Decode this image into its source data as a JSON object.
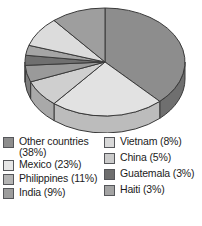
{
  "chart_data": {
    "type": "pie",
    "title": "",
    "subtitle": "",
    "xlabel": "",
    "ylabel": "",
    "legend_position": "bottom",
    "grid": false,
    "three_d": true,
    "start_angle_deg": 0,
    "direction": "clockwise",
    "categories": [
      "Other countries",
      "Mexico",
      "Philippines",
      "India",
      "Vietnam",
      "China",
      "Guatemala",
      "Haiti"
    ],
    "values": [
      38,
      23,
      11,
      9,
      8,
      5,
      3,
      3
    ],
    "units": "percent",
    "slices": [
      {
        "label": "Other countries",
        "value": 38,
        "percent_text": "(38%)",
        "color": "#8d8d8d",
        "side_color": "#6f6f6f"
      },
      {
        "label": "Mexico",
        "value": 23,
        "percent_text": "(23%)",
        "color": "#e2e2e2",
        "side_color": "#bcbcbc"
      },
      {
        "label": "Vietnam",
        "value": 8,
        "percent_text": "(8%)",
        "color": "#cfcfcf",
        "side_color": "#a9a9a9"
      },
      {
        "label": "China",
        "value": 5,
        "percent_text": "(5%)",
        "color": "#9a9a9a",
        "side_color": "#7d7d7d"
      },
      {
        "label": "Guatemala",
        "value": 3,
        "percent_text": "(3%)",
        "color": "#707070",
        "side_color": "#5a5a5a"
      },
      {
        "label": "Haiti",
        "value": 3,
        "percent_text": "(3%)",
        "color": "#a5a5a5",
        "side_color": "#868686"
      },
      {
        "label": "India",
        "value": 9,
        "percent_text": "(9%)",
        "color": "#dcdcdc",
        "side_color": "#b6b6b6"
      },
      {
        "label": "Philippines",
        "value": 11,
        "percent_text": "(11%)",
        "color": "#9e9e9e",
        "side_color": "#818181"
      }
    ]
  },
  "legend": {
    "left_column": [
      {
        "label": "Other countries\n(38%)",
        "swatch_color": "#8d8d8d"
      },
      {
        "label": "Mexico (23%)",
        "swatch_color": "#e6e6e6"
      },
      {
        "label": "Philippines (11%)",
        "swatch_color": "#b4b4b4"
      },
      {
        "label": "India (9%)",
        "swatch_color": "#9d9d9d"
      }
    ],
    "right_column": [
      {
        "label": "Vietnam (8%)",
        "swatch_color": "#d8d8d8"
      },
      {
        "label": "China (5%)",
        "swatch_color": "#cacaca"
      },
      {
        "label": "Guatemala (3%)",
        "swatch_color": "#6e6e6e"
      },
      {
        "label": "Haiti (3%)",
        "swatch_color": "#a3a3a3"
      }
    ]
  },
  "colors": {
    "background": "#ffffff",
    "outline": "#3a3a3a",
    "text": "#1b1b1b"
  }
}
